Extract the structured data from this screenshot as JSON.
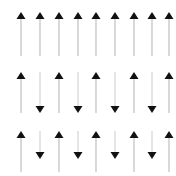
{
  "figure": {
    "background_color": "#ffffff",
    "width": 176,
    "height": 176,
    "columns": 9,
    "rows": 3,
    "column_spacing": 19,
    "first_column_x": 21,
    "head_color": "#111111",
    "shaft_color": "#b9b9b9",
    "shaft_color_light": "#cfcfcf"
  },
  "chart_data": {
    "type": "scatter",
    "title": "",
    "xlabel": "",
    "ylabel": "",
    "grid": false,
    "legend": null,
    "columns": [
      1,
      2,
      3,
      4,
      5,
      6,
      7,
      8,
      9
    ],
    "row_labels": [
      "row-1",
      "row-2",
      "row-3"
    ],
    "series": [
      {
        "name": "row-1",
        "values": [
          1,
          1,
          1,
          1,
          1,
          1,
          1,
          1,
          1
        ],
        "directions": [
          "up",
          "up",
          "up",
          "up",
          "up",
          "up",
          "up",
          "up",
          "up"
        ],
        "lengths": [
          44,
          44,
          44,
          44,
          44,
          44,
          44,
          44,
          44
        ]
      },
      {
        "name": "row-2",
        "values": [
          1,
          -1,
          1,
          -1,
          1,
          -1,
          1,
          -1,
          1
        ],
        "directions": [
          "up",
          "down",
          "up",
          "down",
          "up",
          "down",
          "up",
          "down",
          "up"
        ],
        "lengths": [
          41,
          41,
          41,
          41,
          41,
          41,
          41,
          41,
          41
        ]
      },
      {
        "name": "row-3",
        "values": [
          1,
          -1,
          1,
          -1,
          1,
          -1,
          1,
          -1,
          1
        ],
        "directions": [
          "up",
          "down",
          "up",
          "down",
          "up",
          "down",
          "up",
          "down",
          "up"
        ],
        "lengths": [
          41,
          28,
          41,
          28,
          41,
          28,
          41,
          28,
          41
        ]
      }
    ]
  },
  "rows": [
    {
      "name": "row-1",
      "top": 12,
      "arrows": [
        {
          "name": "arrow-r1-c1",
          "x": 21,
          "dir": "up",
          "length": 44
        },
        {
          "name": "arrow-r1-c2",
          "x": 40,
          "dir": "up",
          "length": 44
        },
        {
          "name": "arrow-r1-c3",
          "x": 59,
          "dir": "up",
          "length": 44
        },
        {
          "name": "arrow-r1-c4",
          "x": 78,
          "dir": "up",
          "length": 44
        },
        {
          "name": "arrow-r1-c5",
          "x": 96,
          "dir": "up",
          "length": 44
        },
        {
          "name": "arrow-r1-c6",
          "x": 115,
          "dir": "up",
          "length": 44
        },
        {
          "name": "arrow-r1-c7",
          "x": 134,
          "dir": "up",
          "length": 44
        },
        {
          "name": "arrow-r1-c8",
          "x": 152,
          "dir": "up",
          "length": 44
        },
        {
          "name": "arrow-r1-c9",
          "x": 169,
          "dir": "up",
          "length": 44
        }
      ]
    },
    {
      "name": "row-2",
      "top": 72,
      "arrows": [
        {
          "name": "arrow-r2-c1",
          "x": 21,
          "dir": "up",
          "length": 41
        },
        {
          "name": "arrow-r2-c2",
          "x": 40,
          "dir": "down",
          "length": 41
        },
        {
          "name": "arrow-r2-c3",
          "x": 59,
          "dir": "up",
          "length": 41
        },
        {
          "name": "arrow-r2-c4",
          "x": 78,
          "dir": "down",
          "length": 41
        },
        {
          "name": "arrow-r2-c5",
          "x": 96,
          "dir": "up",
          "length": 41
        },
        {
          "name": "arrow-r2-c6",
          "x": 115,
          "dir": "down",
          "length": 41
        },
        {
          "name": "arrow-r2-c7",
          "x": 134,
          "dir": "up",
          "length": 41
        },
        {
          "name": "arrow-r2-c8",
          "x": 152,
          "dir": "down",
          "length": 41
        },
        {
          "name": "arrow-r2-c9",
          "x": 169,
          "dir": "up",
          "length": 41
        }
      ]
    },
    {
      "name": "row-3",
      "top": 131,
      "arrows": [
        {
          "name": "arrow-r3-c1",
          "x": 21,
          "dir": "up",
          "length": 41
        },
        {
          "name": "arrow-r3-c2",
          "x": 40,
          "dir": "down",
          "length": 28
        },
        {
          "name": "arrow-r3-c3",
          "x": 59,
          "dir": "up",
          "length": 41
        },
        {
          "name": "arrow-r3-c4",
          "x": 78,
          "dir": "down",
          "length": 28
        },
        {
          "name": "arrow-r3-c5",
          "x": 96,
          "dir": "up",
          "length": 41
        },
        {
          "name": "arrow-r3-c6",
          "x": 115,
          "dir": "down",
          "length": 28
        },
        {
          "name": "arrow-r3-c7",
          "x": 134,
          "dir": "up",
          "length": 41
        },
        {
          "name": "arrow-r3-c8",
          "x": 152,
          "dir": "down",
          "length": 28
        },
        {
          "name": "arrow-r3-c9",
          "x": 169,
          "dir": "up",
          "length": 41
        }
      ]
    }
  ]
}
